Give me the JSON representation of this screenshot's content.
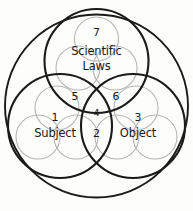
{
  "diagram": {
    "background_color": "#fdfdfb",
    "outer_circle_color": "#1a1a1a",
    "medium_circle_color": "#1a1a1a",
    "small_circle_color": "#b0b0b0",
    "text_color": "#1a1a1a",
    "groups": [
      {
        "id": "scientific-laws",
        "label_line_1": "Scientific",
        "label_line_2": "Laws",
        "region_number": "7"
      },
      {
        "id": "subject",
        "label_line_1": "Subject",
        "label_line_2": "",
        "region_number": "1"
      },
      {
        "id": "object",
        "label_line_1": "Object",
        "label_line_2": "",
        "region_number": "3"
      }
    ],
    "overlap_regions": [
      {
        "id": "subject-laws-overlap",
        "number": "5"
      },
      {
        "id": "laws-object-overlap",
        "number": "6"
      },
      {
        "id": "subject-object-overlap",
        "number": "2"
      },
      {
        "id": "center-triple-overlap",
        "number": "4"
      }
    ]
  }
}
